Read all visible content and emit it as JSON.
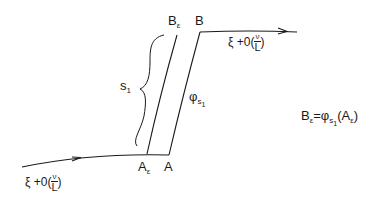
{
  "diagram": {
    "points": {
      "A_eps": {
        "label": "A",
        "sub": "ε"
      },
      "A": {
        "label": "A"
      },
      "B_eps": {
        "label": "B",
        "sub": "ε"
      },
      "B": {
        "label": "B"
      }
    },
    "arc_length_label": {
      "main": "s",
      "sub": "1"
    },
    "flow_label": {
      "main": "φ",
      "sub": "s",
      "subsub": "1"
    },
    "incoming_label": {
      "prefix": "ξ +0(",
      "num": "ν",
      "den": "L",
      "suffix": ")"
    },
    "outgoing_label": {
      "prefix": "ξ +0(",
      "num": "ν",
      "den": "L",
      "suffix": ")"
    },
    "equation": {
      "lhs": "B",
      "lhs_sub": "ε",
      "eq": "=φ",
      "phi_sub": "s",
      "phi_subsub": "1",
      "arg_open": "(A",
      "arg_sub": "ε",
      "arg_close": ")"
    },
    "stroke_color": "#1a1a1a"
  }
}
